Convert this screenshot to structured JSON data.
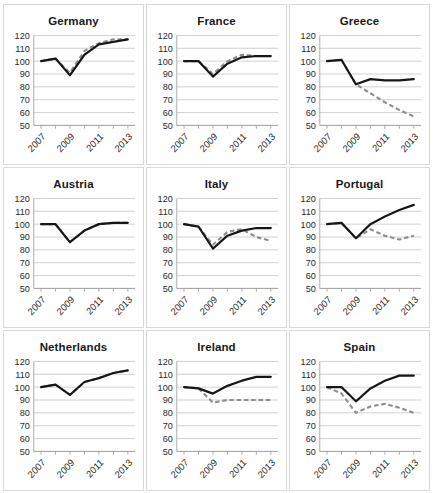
{
  "figure": {
    "layout": "3x3 small multiples",
    "rows": 3,
    "columns": 3
  },
  "axis": {
    "y_ticks": [
      50,
      60,
      70,
      80,
      90,
      100,
      110,
      120
    ],
    "x_ticks": [
      2007,
      2009,
      2011,
      2013
    ],
    "x_tick_labels": [
      "2007",
      "2009",
      "2011",
      "2013"
    ],
    "ylim": [
      50,
      120
    ],
    "xlim": [
      2006.5,
      2013.5
    ],
    "grid": true,
    "legend": "none",
    "colors": {
      "solid_series": "#161616",
      "dashed_series": "#8d8d8d",
      "gridline": "#bfbfbf",
      "panel_border": "#d9d9d9",
      "background": "#ffffff"
    }
  },
  "chart_data": [
    {
      "type": "line",
      "title": "Germany",
      "xlabel": "",
      "ylabel": "",
      "ylim": [
        50,
        120
      ],
      "x": [
        2007,
        2008,
        2009,
        2010,
        2011,
        2012,
        2013
      ],
      "series": [
        {
          "name": "solid",
          "style": "solid",
          "values": [
            100,
            102,
            89,
            105,
            113,
            115,
            117
          ]
        },
        {
          "name": "dashed",
          "style": "dashed",
          "values": [
            100,
            102,
            91,
            108,
            114,
            117,
            117
          ]
        }
      ]
    },
    {
      "type": "line",
      "title": "France",
      "xlabel": "",
      "ylabel": "",
      "ylim": [
        50,
        120
      ],
      "x": [
        2007,
        2008,
        2009,
        2010,
        2011,
        2012,
        2013
      ],
      "series": [
        {
          "name": "solid",
          "style": "solid",
          "values": [
            100,
            100,
            88,
            98,
            103,
            104,
            104
          ]
        },
        {
          "name": "dashed",
          "style": "dashed",
          "values": [
            100,
            100,
            90,
            100,
            105,
            104,
            104
          ]
        }
      ]
    },
    {
      "type": "line",
      "title": "Greece",
      "xlabel": "",
      "ylabel": "",
      "ylim": [
        50,
        120
      ],
      "x": [
        2007,
        2008,
        2009,
        2010,
        2011,
        2012,
        2013
      ],
      "series": [
        {
          "name": "solid",
          "style": "solid",
          "values": [
            100,
            101,
            82,
            86,
            85,
            85,
            86
          ]
        },
        {
          "name": "dashed",
          "style": "dashed",
          "values": [
            100,
            101,
            82,
            75,
            68,
            62,
            57
          ]
        }
      ]
    },
    {
      "type": "line",
      "title": "Austria",
      "xlabel": "",
      "ylabel": "",
      "ylim": [
        50,
        120
      ],
      "x": [
        2007,
        2008,
        2009,
        2010,
        2011,
        2012,
        2013
      ],
      "series": [
        {
          "name": "solid",
          "style": "solid",
          "values": [
            100,
            100,
            86,
            95,
            100,
            101,
            101
          ]
        },
        {
          "name": "dashed",
          "style": "dashed",
          "values": [
            100,
            100,
            86,
            95,
            100,
            101,
            101
          ]
        }
      ]
    },
    {
      "type": "line",
      "title": "Italy",
      "xlabel": "",
      "ylabel": "",
      "ylim": [
        50,
        120
      ],
      "x": [
        2007,
        2008,
        2009,
        2010,
        2011,
        2012,
        2013
      ],
      "series": [
        {
          "name": "solid",
          "style": "solid",
          "values": [
            100,
            98,
            81,
            91,
            95,
            97,
            97
          ]
        },
        {
          "name": "dashed",
          "style": "dashed",
          "values": [
            100,
            98,
            84,
            94,
            96,
            90,
            87
          ]
        }
      ]
    },
    {
      "type": "line",
      "title": "Portugal",
      "xlabel": "",
      "ylabel": "",
      "ylim": [
        50,
        120
      ],
      "x": [
        2007,
        2008,
        2009,
        2010,
        2011,
        2012,
        2013
      ],
      "series": [
        {
          "name": "solid",
          "style": "solid",
          "values": [
            100,
            101,
            89,
            100,
            106,
            111,
            115
          ]
        },
        {
          "name": "dashed",
          "style": "dashed",
          "values": [
            100,
            101,
            89,
            96,
            91,
            88,
            91
          ]
        }
      ]
    },
    {
      "type": "line",
      "title": "Netherlands",
      "xlabel": "",
      "ylabel": "",
      "ylim": [
        50,
        120
      ],
      "x": [
        2007,
        2008,
        2009,
        2010,
        2011,
        2012,
        2013
      ],
      "series": [
        {
          "name": "solid",
          "style": "solid",
          "values": [
            100,
            102,
            94,
            104,
            107,
            111,
            113
          ]
        },
        {
          "name": "dashed",
          "style": "dashed",
          "values": [
            100,
            102,
            94,
            104,
            107,
            111,
            113
          ]
        }
      ]
    },
    {
      "type": "line",
      "title": "Ireland",
      "xlabel": "",
      "ylabel": "",
      "ylim": [
        50,
        120
      ],
      "x": [
        2007,
        2008,
        2009,
        2010,
        2011,
        2012,
        2013
      ],
      "series": [
        {
          "name": "solid",
          "style": "solid",
          "values": [
            100,
            99,
            95,
            101,
            105,
            108,
            108
          ]
        },
        {
          "name": "dashed",
          "style": "dashed",
          "values": [
            100,
            99,
            88,
            90,
            90,
            90,
            90
          ]
        }
      ]
    },
    {
      "type": "line",
      "title": "Spain",
      "xlabel": "",
      "ylabel": "",
      "ylim": [
        50,
        120
      ],
      "x": [
        2007,
        2008,
        2009,
        2010,
        2011,
        2012,
        2013
      ],
      "series": [
        {
          "name": "solid",
          "style": "solid",
          "values": [
            100,
            100,
            89,
            99,
            105,
            109,
            109
          ]
        },
        {
          "name": "dashed",
          "style": "dashed",
          "values": [
            100,
            95,
            80,
            85,
            87,
            84,
            80
          ]
        }
      ]
    }
  ]
}
